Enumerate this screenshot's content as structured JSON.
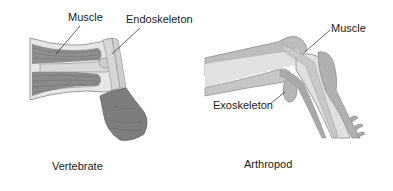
{
  "vertebrate": {
    "caption": "Vertebrate",
    "labels": {
      "muscle": "Muscle",
      "skeleton": "Endoskeleton"
    }
  },
  "arthropod": {
    "caption": "Arthropod",
    "labels": {
      "muscle": "Muscle",
      "skeleton": "Exoskeleton"
    }
  },
  "colors": {
    "muscle": "#8c8c8c",
    "bone": "#d4d4d4",
    "outline": "#7a7a7a",
    "fist": "#7d7d7d",
    "shell": "#a8a8a8",
    "inner": "#dcdcdc",
    "text": "#1a1a1a"
  }
}
